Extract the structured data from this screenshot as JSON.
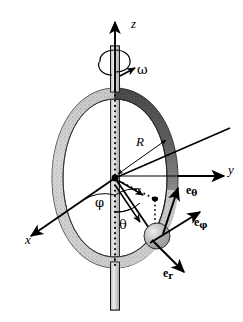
{
  "figure": {
    "background_color": "#ffffff",
    "ink_color": "#000000",
    "width": 243,
    "height": 322
  },
  "axes": [
    {
      "name": "z-axis",
      "label": "z",
      "direction": "up",
      "x": 131,
      "y": 24
    },
    {
      "name": "y-axis",
      "label": "y",
      "direction": "right",
      "x": 228,
      "y": 169
    },
    {
      "name": "x-axis",
      "label": "x",
      "direction": "down-left",
      "x": 27,
      "y": 239
    }
  ],
  "angles": [
    {
      "name": "phi",
      "label": "φ",
      "x": 96,
      "y": 201
    },
    {
      "name": "theta",
      "label": "θ",
      "x": 120,
      "y": 222
    }
  ],
  "rotation": {
    "name": "angular-velocity",
    "label": "ω",
    "x": 137,
    "y": 70
  },
  "radius": {
    "name": "hoop-radius",
    "label": "R",
    "x": 137,
    "y": 142
  },
  "unit_vectors": [
    {
      "name": "e-theta",
      "base": "e",
      "sub": "θ",
      "x": 189,
      "y": 190
    },
    {
      "name": "e-phi",
      "base": "e",
      "sub": "φ",
      "x": 197,
      "y": 221
    },
    {
      "name": "e-r",
      "base": "e",
      "sub": "r",
      "x": 166,
      "y": 272
    }
  ],
  "objects": {
    "hoop": {
      "name": "rotating-hoop",
      "center_x": 115,
      "center_y": 178,
      "rx": 63,
      "ry": 90,
      "band_width": 11,
      "shade_left": "#c9c9c9",
      "shade_right_top": "#4a4a4a",
      "shade_right_bottom": "#b5b5b5"
    },
    "bead": {
      "name": "bead",
      "cx": 157,
      "cy": 236,
      "r": 13,
      "fill": "#b9b9b9"
    },
    "shaft": {
      "name": "rotation-shaft",
      "top_x": 115,
      "top_y": 46,
      "bottom_y": 310,
      "width": 9,
      "fill": "#d6d6d6"
    },
    "origin": {
      "name": "origin-point",
      "x": 115,
      "y": 178
    },
    "dotted_axis": {
      "name": "vertical-dotted-axis",
      "x": 115,
      "y_top": 90,
      "y_bottom": 268
    }
  }
}
